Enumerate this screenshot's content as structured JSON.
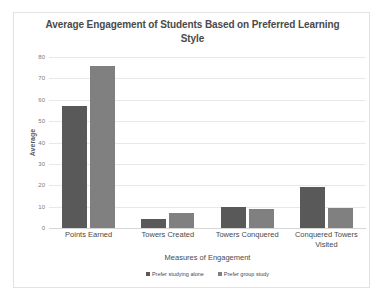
{
  "chart_data": {
    "type": "bar",
    "title": "Average Engagement of Students Based on Preferred Learning Style",
    "xlabel": "Measures of Engagement",
    "ylabel": "Average",
    "ylim": [
      0,
      80
    ],
    "yticks": [
      0,
      10,
      20,
      30,
      40,
      50,
      60,
      70,
      80
    ],
    "grid": true,
    "legend_position": "bottom",
    "categories": [
      "Points Earned",
      "Towers Created",
      "Towers Conquered",
      "Conquered Towers Visited"
    ],
    "series": [
      {
        "name": "Prefer studying alone",
        "color": "#595959",
        "values": [
          57,
          4,
          10,
          19
        ]
      },
      {
        "name": "Prefer group study",
        "color": "#808080",
        "values": [
          76,
          7,
          9,
          9.5
        ]
      }
    ]
  }
}
